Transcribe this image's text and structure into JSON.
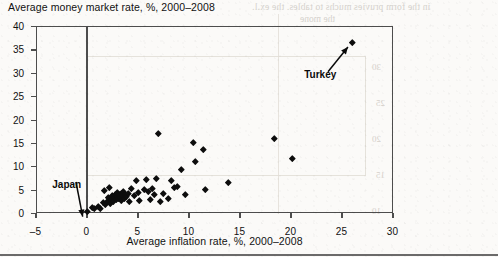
{
  "chart_title": "Average money market rate, %, 2000–2008",
  "bleed_through": {
    "line1": "in the form pruvies muchs to tables. the ex.l.",
    "line2": "the mone",
    "numbers": [
      "30",
      "25",
      "20",
      "15",
      "10"
    ]
  },
  "chart_data": {
    "type": "scatter",
    "title": "Average money market rate, %, 2000–2008",
    "xlabel": "Average inflation rate, %, 2000–2008",
    "ylabel": "Average money market rate, %, 2000–2008",
    "xlim": [
      -5,
      30
    ],
    "ylim": [
      0,
      40
    ],
    "xticks": [
      -5,
      0,
      5,
      10,
      15,
      20,
      25,
      30
    ],
    "yticks": [
      0,
      5,
      10,
      15,
      20,
      25,
      30,
      35,
      40
    ],
    "xtick_labels": [
      "–5",
      "0",
      "5",
      "10",
      "15",
      "20",
      "25",
      "30"
    ],
    "ytick_labels": [
      "0",
      "5",
      "10",
      "15",
      "20",
      "25",
      "30",
      "35",
      "40"
    ],
    "grid": false,
    "legend": "none",
    "marker": "diamond",
    "marker_color": "#0d0d0d",
    "annotations": [
      {
        "label": "Japan",
        "point_x": 0.0,
        "point_y": 0.3,
        "label_x": -3.4,
        "label_y": 6.0
      },
      {
        "label": "Turkey",
        "point_x": 26.0,
        "point_y": 36.5,
        "label_x": 21.3,
        "label_y": 29.5
      }
    ],
    "points": [
      {
        "x": 0.0,
        "y": 0.3
      },
      {
        "x": 0.5,
        "y": 1.2
      },
      {
        "x": 0.7,
        "y": 1.0
      },
      {
        "x": 1.1,
        "y": 1.4
      },
      {
        "x": 1.3,
        "y": 1.1
      },
      {
        "x": 1.6,
        "y": 2.3
      },
      {
        "x": 1.8,
        "y": 1.9
      },
      {
        "x": 2.0,
        "y": 2.6
      },
      {
        "x": 2.1,
        "y": 3.4
      },
      {
        "x": 2.3,
        "y": 2.1
      },
      {
        "x": 2.4,
        "y": 3.0
      },
      {
        "x": 2.5,
        "y": 3.7
      },
      {
        "x": 2.6,
        "y": 2.5
      },
      {
        "x": 2.7,
        "y": 3.3
      },
      {
        "x": 2.8,
        "y": 4.0
      },
      {
        "x": 2.9,
        "y": 2.9
      },
      {
        "x": 3.0,
        "y": 3.6
      },
      {
        "x": 3.0,
        "y": 4.4
      },
      {
        "x": 3.1,
        "y": 3.1
      },
      {
        "x": 3.2,
        "y": 3.9
      },
      {
        "x": 3.3,
        "y": 3.4
      },
      {
        "x": 3.4,
        "y": 4.2
      },
      {
        "x": 3.4,
        "y": 2.7
      },
      {
        "x": 3.5,
        "y": 3.7
      },
      {
        "x": 3.6,
        "y": 4.6
      },
      {
        "x": 3.7,
        "y": 3.2
      },
      {
        "x": 3.8,
        "y": 4.0
      },
      {
        "x": 3.9,
        "y": 3.5
      },
      {
        "x": 4.0,
        "y": 4.3
      },
      {
        "x": 4.1,
        "y": 2.4
      },
      {
        "x": 4.3,
        "y": 5.2
      },
      {
        "x": 4.6,
        "y": 3.8
      },
      {
        "x": 2.2,
        "y": 5.5
      },
      {
        "x": 1.7,
        "y": 4.9
      },
      {
        "x": 4.8,
        "y": 7.0
      },
      {
        "x": 5.0,
        "y": 4.4
      },
      {
        "x": 5.1,
        "y": 2.8
      },
      {
        "x": 5.6,
        "y": 5.0
      },
      {
        "x": 5.8,
        "y": 7.2
      },
      {
        "x": 6.0,
        "y": 4.6
      },
      {
        "x": 6.2,
        "y": 3.0
      },
      {
        "x": 6.4,
        "y": 5.3
      },
      {
        "x": 6.6,
        "y": 4.1
      },
      {
        "x": 6.8,
        "y": 7.4
      },
      {
        "x": 7.0,
        "y": 17.0
      },
      {
        "x": 7.2,
        "y": 2.5
      },
      {
        "x": 7.5,
        "y": 4.2
      },
      {
        "x": 8.0,
        "y": 3.1
      },
      {
        "x": 8.3,
        "y": 7.1
      },
      {
        "x": 8.6,
        "y": 5.4
      },
      {
        "x": 8.9,
        "y": 5.7
      },
      {
        "x": 9.2,
        "y": 9.4
      },
      {
        "x": 9.6,
        "y": 3.9
      },
      {
        "x": 10.4,
        "y": 15.2
      },
      {
        "x": 10.6,
        "y": 11.1
      },
      {
        "x": 11.4,
        "y": 13.6
      },
      {
        "x": 11.6,
        "y": 5.0
      },
      {
        "x": 13.9,
        "y": 6.5
      },
      {
        "x": 18.4,
        "y": 16.0
      },
      {
        "x": 20.1,
        "y": 11.6
      },
      {
        "x": 26.0,
        "y": 36.5
      }
    ]
  }
}
